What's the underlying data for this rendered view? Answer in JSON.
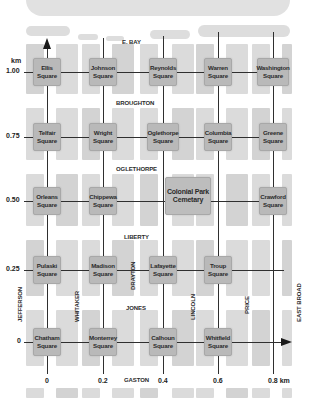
{
  "map": {
    "axis": {
      "y_unit": "km",
      "y_ticks": [
        "1.00",
        "0.75",
        "0.50",
        "0.25",
        "0"
      ],
      "x_ticks": [
        "0",
        "0.2",
        "0.4",
        "0.6",
        "0.8 km"
      ]
    },
    "streets": {
      "horizontal": [
        "E. BAY",
        "BROUGHTON",
        "OGLETHORPE",
        "LIBERTY",
        "JONES",
        "GASTON"
      ],
      "vertical": [
        "JEFFERSON",
        "WHITAKER",
        "DRAYTON",
        "LINCOLN",
        "PRICE",
        "EAST BROAD"
      ]
    },
    "squares": {
      "ellis": "Ellis\nSquare",
      "johnson": "Johnson\nSquare",
      "reynolds": "Reynolds\nSquare",
      "warren": "Warren\nSquare",
      "washington": "Washington\nSquare",
      "telfair": "Telfair\nSquare",
      "wright": "Wright\nSquare",
      "oglethorpe": "Oglethorpe\nSquare",
      "columbia": "Columbia\nSquare",
      "greene": "Greene\nSquare",
      "orleans": "Orleans\nSquare",
      "chippewa": "Chippewa\nSquare",
      "colonial_park": "Colonial Park\nCemetary",
      "crawford": "Crawford\nSquare",
      "pulaski": "Pulaski\nSquare",
      "madison": "Madison\nSquare",
      "lafayette": "Lafayette\nSquare",
      "troup": "Troup\nSquare",
      "chatham": "Chatham\nSquare",
      "monterrey": "Monterrey\nSquare",
      "calhoun": "Calhoun\nSquare",
      "whitfield": "Whitfield\nSquare"
    },
    "colors": {
      "block": "#cfcfcf",
      "square": "#b9b9b9",
      "axis_line": "#2f2f2f",
      "text": "#2b2b2b"
    }
  }
}
